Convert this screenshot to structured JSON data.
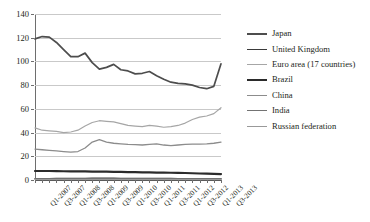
{
  "chart_data": {
    "type": "line",
    "title": "",
    "xlabel": "",
    "ylabel": "",
    "ylim": [
      0,
      140
    ],
    "ystep": 20,
    "grid": true,
    "legend_position": "right",
    "yticks": [
      "140",
      "120",
      "100",
      "80",
      "60",
      "40",
      "20",
      "0"
    ],
    "x": [
      "Q1-2007",
      "Q2-2007",
      "Q3-2007",
      "Q4-2007",
      "Q1-2008",
      "Q2-2008",
      "Q3-2008",
      "Q4-2008",
      "Q1-2009",
      "Q2-2009",
      "Q3-2009",
      "Q4-2009",
      "Q1-2010",
      "Q2-2010",
      "Q3-2010",
      "Q4-2010",
      "Q1-2011",
      "Q2-2011",
      "Q3-2011",
      "Q4-2011",
      "Q1-2012",
      "Q2-2012",
      "Q3-2012",
      "Q4-2012",
      "Q1-2013",
      "Q2-2013",
      "Q3-2013"
    ],
    "xtick_labels": [
      "Q1-2007",
      "Q3-2007",
      "Q1-2008",
      "Q3-2008",
      "Q1-2009",
      "Q3-2009",
      "Q1-2010",
      "Q3-2010",
      "Q1-2011",
      "Q3-2011",
      "Q1-2012",
      "Q3-2012",
      "Q1-2013",
      "Q3-2013"
    ],
    "series": [
      {
        "name": "Japan",
        "color": "#4d4d4d",
        "width": 1.7,
        "values": [
          119,
          121,
          120.5,
          116,
          110,
          104,
          104,
          107,
          99,
          93.5,
          95,
          97.5,
          93,
          92,
          89.5,
          90,
          91.5,
          88,
          85,
          82.5,
          81.5,
          81,
          80,
          78,
          77,
          79,
          98
        ]
      },
      {
        "name": "United Kingdom",
        "color": "#3a3a3a",
        "width": 1.4,
        "values": [
          1.2,
          1.2,
          1.2,
          1.3,
          1.3,
          1.3,
          1.4,
          1.4,
          1.5,
          1.5,
          1.5,
          1.5,
          1.4,
          1.4,
          1.4,
          1.4,
          1.3,
          1.3,
          1.3,
          1.3,
          1.2,
          1.2,
          1.2,
          1.2,
          1.1,
          1.1,
          1.1
        ]
      },
      {
        "name": "Euro area (17 countries)",
        "color": "#a6a6a6",
        "width": 1.2,
        "values": [
          44,
          42,
          41.5,
          41,
          40,
          40.5,
          42,
          45.5,
          48.5,
          50,
          49.5,
          49,
          47.5,
          46,
          45.5,
          45,
          46,
          45.5,
          44.5,
          45,
          46,
          48,
          51,
          53,
          54,
          56,
          61
        ]
      },
      {
        "name": "Brazil",
        "color": "#2b2b2b",
        "width": 2.2,
        "values": [
          7.6,
          7.6,
          7.6,
          7.5,
          7.4,
          7.3,
          7.2,
          7.2,
          7.1,
          7.0,
          7.0,
          6.9,
          6.8,
          6.7,
          6.6,
          6.5,
          6.4,
          6.3,
          6.2,
          6.1,
          6.0,
          5.9,
          5.7,
          5.5,
          5.3,
          5.1,
          5.0
        ]
      },
      {
        "name": "China",
        "color": "#8c8c8c",
        "width": 1.3,
        "values": [
          26,
          25.5,
          25,
          24.5,
          24,
          23.5,
          24,
          27,
          32,
          34,
          32,
          31,
          30.5,
          30,
          29.8,
          29.5,
          30,
          30.5,
          29.5,
          29,
          29.5,
          30,
          30.2,
          30.3,
          30.5,
          31,
          32
        ]
      },
      {
        "name": "India",
        "color": "#737373",
        "width": 1.2,
        "values": [
          0.9,
          0.9,
          0.9,
          1.0,
          1.0,
          1.0,
          1.0,
          1.0,
          1.0,
          1.0,
          1.0,
          1.0,
          1.0,
          1.0,
          1.0,
          1.0,
          1.0,
          1.0,
          0.9,
          0.9,
          0.9,
          0.9,
          0.9,
          0.9,
          0.9,
          0.9,
          0.9
        ]
      },
      {
        "name": "Russian federation",
        "color": "#999999",
        "width": 1.2,
        "values": [
          0.5,
          0.5,
          0.5,
          0.5,
          0.5,
          0.5,
          0.5,
          0.5,
          0.5,
          0.5,
          0.5,
          0.5,
          0.5,
          0.5,
          0.5,
          0.5,
          0.5,
          0.5,
          0.5,
          0.5,
          0.5,
          0.5,
          0.5,
          0.5,
          0.5,
          0.5,
          0.5
        ]
      }
    ]
  }
}
